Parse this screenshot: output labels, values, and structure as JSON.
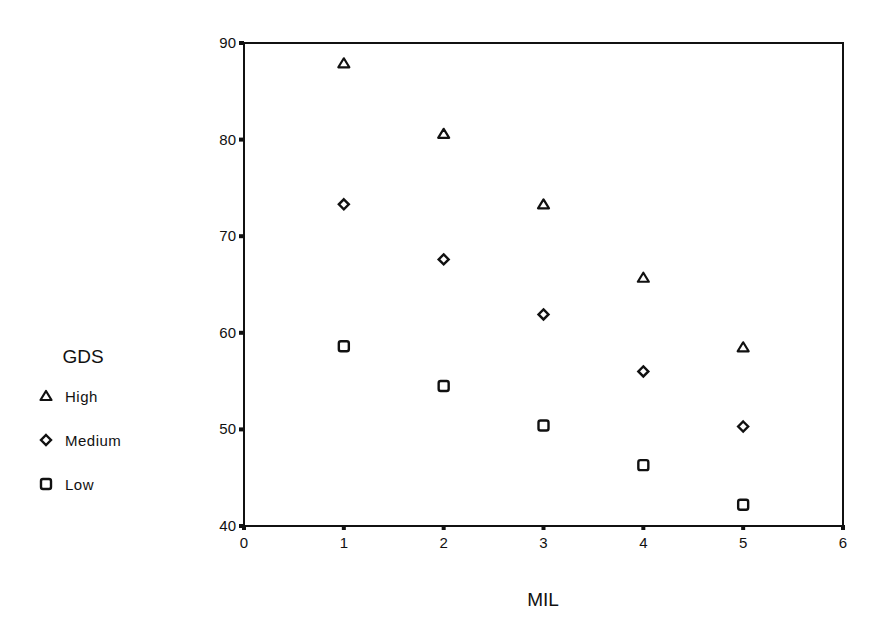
{
  "chart_data": {
    "type": "scatter",
    "title": "",
    "xlabel": "MIL",
    "ylabel": "",
    "xlim": [
      0,
      6
    ],
    "ylim": [
      40,
      90
    ],
    "xticks": [
      0,
      1,
      2,
      3,
      4,
      5,
      6
    ],
    "yticks": [
      40,
      50,
      60,
      70,
      80,
      90
    ],
    "grid": false,
    "legend": {
      "title": "GDS",
      "position": "left",
      "entries": [
        {
          "label": "High",
          "marker": "triangle"
        },
        {
          "label": "Medium",
          "marker": "diamond"
        },
        {
          "label": "Low",
          "marker": "square"
        }
      ]
    },
    "x": [
      1,
      2,
      3,
      4,
      5
    ],
    "series": [
      {
        "name": "High",
        "marker": "triangle",
        "values": [
          87.9,
          80.6,
          73.3,
          65.7,
          58.5
        ]
      },
      {
        "name": "Medium",
        "marker": "diamond",
        "values": [
          73.3,
          67.6,
          61.9,
          56.0,
          50.3
        ]
      },
      {
        "name": "Low",
        "marker": "square",
        "values": [
          58.6,
          54.5,
          50.4,
          46.3,
          42.2
        ]
      }
    ]
  },
  "colors": {
    "axis": "#111111",
    "marker": "#111111",
    "background": "#ffffff"
  }
}
